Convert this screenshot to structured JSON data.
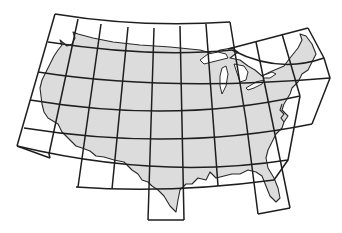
{
  "map": {
    "subject": "Contiguous United States map-sheet index",
    "colors": {
      "land": "#dcdcdc",
      "water": "#ffffff",
      "grid_lines": "#1e1e1e",
      "outline": "#2a2a2a"
    },
    "grid": {
      "description": "Curved latitude bands and slanted meridian columns forming quadrilateral map sheets",
      "rows": 6,
      "columns": 10,
      "extensions": [
        "south-texas sheet",
        "south-florida sheets",
        "new-england sheets"
      ]
    }
  }
}
